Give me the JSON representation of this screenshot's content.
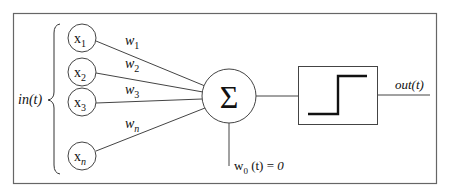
{
  "diagram": {
    "type": "perceptron",
    "input_group_label": "in(t)",
    "inputs": [
      {
        "base": "x",
        "sub": "1",
        "weight_base": "w",
        "weight_sub": "1"
      },
      {
        "base": "x",
        "sub": "2",
        "weight_base": "w",
        "weight_sub": "2"
      },
      {
        "base": "x",
        "sub": "3",
        "weight_base": "w",
        "weight_sub": "3"
      },
      {
        "base": "x",
        "sub": "n",
        "weight_base": "w",
        "weight_sub": "n"
      }
    ],
    "summation_symbol": "Σ",
    "bias": {
      "base": "w",
      "sub": "0",
      "rest": " (t) = ",
      "value": "0"
    },
    "activation": "step-function",
    "output_label": "out(t)",
    "colors": {
      "line": "#555555",
      "stroke_dark": "#111111",
      "border": "#666666",
      "background": "#ffffff"
    }
  }
}
